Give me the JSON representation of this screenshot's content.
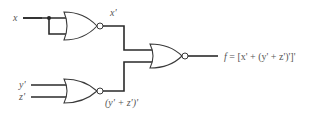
{
  "diagram": {
    "type": "logic-circuit",
    "inputs": {
      "x": "x",
      "y_prime": "y'",
      "z_prime": "z'"
    },
    "gates": [
      {
        "id": "gate-1",
        "type": "NOR",
        "inputs": [
          "x",
          "x"
        ],
        "output": "x'"
      },
      {
        "id": "gate-2",
        "type": "NOR",
        "inputs": [
          "y'",
          "z'"
        ],
        "output": "(y' + z')'"
      },
      {
        "id": "gate-3",
        "type": "NOR",
        "inputs": [
          "x'",
          "(y' + z')'"
        ],
        "output": "f"
      }
    ],
    "labels": {
      "x_out": "x'",
      "yz_out": "(y' + z')'",
      "f_name": "f",
      "f_expr": " = [x' + (y' + z')']'"
    },
    "colors": {
      "wire": "#2a2a2a",
      "gate_stroke": "#3a3a3a",
      "text": "#555555",
      "background": "#ffffff"
    }
  }
}
